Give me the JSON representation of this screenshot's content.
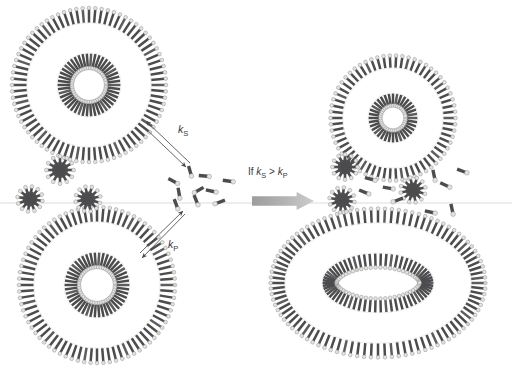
{
  "figure": {
    "width": 512,
    "height": 374,
    "background_color": "#ffffff",
    "scan_line": {
      "y": 203,
      "color": "#d8d8d8",
      "visible": true
    }
  },
  "palette": {
    "tail_dark": "#4c4c4e",
    "tail_mid": "#5d5d5f",
    "tail_light": "#7c7c7e",
    "head_light": "#e3e3e1",
    "head_outline": "#8e8e8c",
    "marker_head": "#cfd4c6",
    "marker_outline": "#9aa08f",
    "guide_line": "#f2f2f0",
    "arrow_stroke": "#4a4a4c",
    "block_arrow_from": "#9f9f9f",
    "block_arrow_to": "#c9c9c9",
    "text": "#39393b"
  },
  "labels": {
    "k_s": {
      "text_prefix": "k",
      "text_sub": "S",
      "x": 178,
      "y": 133
    },
    "k_p": {
      "text_prefix": "k",
      "text_sub": "P",
      "x": 168,
      "y": 248
    },
    "condition": {
      "full_text": "If kS > kP",
      "if_text": "If ",
      "k1": "k",
      "sub1": "S",
      "gt": " > ",
      "k2": "k",
      "sub2": "P",
      "x": 248,
      "y": 175
    }
  },
  "structures": {
    "vesicle_top_left": {
      "name": "spherical-vesicle-small-surfactant",
      "shape": "circle",
      "cx": 89,
      "cy": 85,
      "outer_radius": 62,
      "inner_radius": 32,
      "outer_count": 76,
      "inner_count": 46,
      "has_markers": false,
      "marker_count": 0
    },
    "vesicle_bottom_left": {
      "name": "spherical-vesicle-mixed-surfactant",
      "shape": "circle",
      "cx": 97,
      "cy": 285,
      "outer_radius": 63,
      "inner_radius": 33,
      "outer_count": 76,
      "inner_count": 46,
      "has_markers": true,
      "marker_count": 9
    },
    "vesicle_top_right": {
      "name": "spherical-vesicle-shrunken",
      "shape": "circle",
      "cx": 393,
      "cy": 118,
      "outer_radius": 50,
      "inner_radius": 25,
      "outer_count": 62,
      "inner_count": 36,
      "has_markers": false,
      "marker_count": 0
    },
    "vesicle_bottom_right": {
      "name": "ellipsoidal-vesicle-grown",
      "shape": "ellipse",
      "cx": 378,
      "cy": 283,
      "outer_rx": 93,
      "outer_ry": 60,
      "inner_rx": 56,
      "inner_ry": 30,
      "outer_count": 92,
      "inner_count": 62,
      "has_markers": true,
      "marker_count": 11
    }
  },
  "micelles": {
    "left": [
      {
        "cx": 60,
        "cy": 170,
        "radius": 13,
        "arms": 12
      },
      {
        "cx": 30,
        "cy": 199,
        "radius": 12,
        "arms": 12
      },
      {
        "cx": 88,
        "cy": 199,
        "radius": 12,
        "arms": 12
      }
    ],
    "right": [
      {
        "cx": 345,
        "cy": 167,
        "radius": 12,
        "arms": 12
      },
      {
        "cx": 342,
        "cy": 200,
        "radius": 12,
        "arms": 12
      },
      {
        "cx": 413,
        "cy": 190,
        "radius": 12,
        "arms": 12
      }
    ]
  },
  "monomers": {
    "left_cluster": [
      {
        "x": 190,
        "y": 171,
        "angle": 74
      },
      {
        "x": 173,
        "y": 181,
        "angle": 28
      },
      {
        "x": 204,
        "y": 176,
        "angle": 5
      },
      {
        "x": 228,
        "y": 181,
        "angle": 8
      },
      {
        "x": 179,
        "y": 193,
        "angle": 80
      },
      {
        "x": 199,
        "y": 190,
        "angle": 150
      },
      {
        "x": 211,
        "y": 191,
        "angle": 12
      },
      {
        "x": 176,
        "y": 204,
        "angle": 70
      },
      {
        "x": 196,
        "y": 200,
        "angle": 68
      },
      {
        "x": 220,
        "y": 202,
        "angle": 160
      }
    ],
    "right_cluster": [
      {
        "x": 370,
        "y": 179,
        "angle": 15
      },
      {
        "x": 434,
        "y": 175,
        "angle": 78
      },
      {
        "x": 364,
        "y": 192,
        "angle": 22
      },
      {
        "x": 388,
        "y": 188,
        "angle": 10
      },
      {
        "x": 445,
        "y": 185,
        "angle": 25
      },
      {
        "x": 398,
        "y": 200,
        "angle": 160
      },
      {
        "x": 430,
        "y": 212,
        "angle": 12
      },
      {
        "x": 452,
        "y": 209,
        "angle": 78
      },
      {
        "x": 462,
        "y": 171,
        "angle": 20
      }
    ]
  },
  "arrows": {
    "k_s_pair": {
      "name": "reversible-arrow-ks",
      "a": {
        "x1": 190,
        "y1": 163,
        "x2": 146,
        "y2": 121
      },
      "b": {
        "x1": 143,
        "y1": 126,
        "x2": 186,
        "y2": 167
      }
    },
    "k_p_pair": {
      "name": "reversible-arrow-kp",
      "a": {
        "x1": 185,
        "y1": 214,
        "x2": 142,
        "y2": 258
      },
      "b": {
        "x1": 140,
        "y1": 253,
        "x2": 183,
        "y2": 211
      }
    },
    "transition": {
      "name": "transition-block-arrow",
      "x": 252,
      "y": 192,
      "width": 62,
      "height": 18
    }
  }
}
